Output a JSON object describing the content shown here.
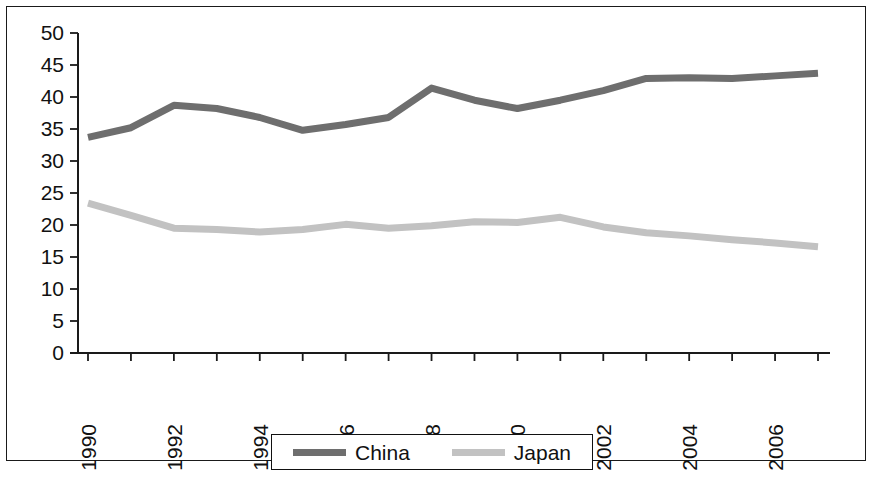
{
  "chart_data": {
    "type": "line",
    "title": "",
    "subtitle": "",
    "xlabel": "",
    "ylabel": "",
    "xlim": [
      1990,
      2007
    ],
    "ylim": [
      0,
      50
    ],
    "grid": false,
    "legend_position": "bottom",
    "x": [
      1990,
      1991,
      1992,
      1993,
      1994,
      1995,
      1996,
      1997,
      1998,
      1999,
      2000,
      2001,
      2002,
      2003,
      2004,
      2005,
      2006,
      2007
    ],
    "x_tick_labels": [
      "1990",
      "",
      "1992",
      "",
      "1994",
      "",
      "1996",
      "",
      "1998",
      "",
      "2000",
      "",
      "2002",
      "",
      "2004",
      "",
      "2006",
      ""
    ],
    "x_tick_labels_visible": [
      "1990",
      "1992",
      "1994",
      "1996",
      "1998",
      "2000",
      "2002",
      "2004",
      "2006"
    ],
    "y_ticks": [
      0,
      5,
      10,
      15,
      20,
      25,
      30,
      35,
      40,
      45,
      50
    ],
    "y_tick_labels": [
      "0",
      "5",
      "10",
      "15",
      "20",
      "25",
      "30",
      "35",
      "40",
      "45",
      "50"
    ],
    "series": [
      {
        "name": "China",
        "color": "#6e6e6e",
        "line_width": 7,
        "values": [
          33.7,
          35.2,
          38.7,
          38.2,
          36.8,
          34.8,
          35.7,
          36.8,
          41.4,
          39.5,
          38.2,
          39.5,
          41.0,
          42.9,
          43.0,
          42.9,
          43.3,
          43.7
        ]
      },
      {
        "name": "Japan",
        "color": "#c2c2c2",
        "line_width": 7,
        "values": [
          23.4,
          21.5,
          19.5,
          19.3,
          18.9,
          19.3,
          20.1,
          19.5,
          19.9,
          20.5,
          20.4,
          21.2,
          19.7,
          18.8,
          18.3,
          17.7,
          17.2,
          16.6
        ]
      }
    ]
  },
  "legend": {
    "entries": [
      {
        "label": "China",
        "color": "#6e6e6e"
      },
      {
        "label": "Japan",
        "color": "#c2c2c2"
      }
    ]
  },
  "colors": {
    "axis": "#1a1a1a",
    "text": "#111111",
    "background": "#ffffff",
    "border": "#1a1a1a"
  }
}
